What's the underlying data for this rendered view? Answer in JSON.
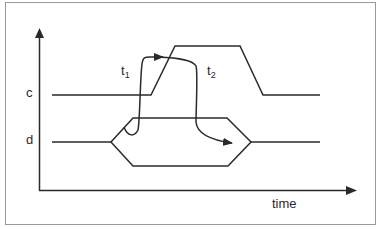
{
  "diagram": {
    "type": "timing-diagram",
    "axes": {
      "x_label": "time",
      "y_signals": [
        "c",
        "d"
      ]
    },
    "annotations": {
      "t1_base": "t",
      "t1_sub": "1",
      "t2_base": "t",
      "t2_sub": "2"
    },
    "colors": {
      "line": "#2a2a2a",
      "frame": "#9a9a9a",
      "background": "#ffffff"
    }
  }
}
